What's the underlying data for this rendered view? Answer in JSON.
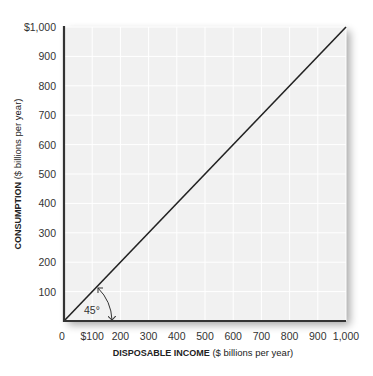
{
  "chart_data": {
    "type": "line",
    "title": "",
    "xlabel": "DISPOSABLE INCOME ($ billions per year)",
    "xlabel_bold": "DISPOSABLE INCOME",
    "xlabel_rest": " ($ billions per year)",
    "ylabel": "CONSUMPTION ($ billions per year)",
    "ylabel_bold": "CONSUMPTION",
    "ylabel_rest": " ($ billions per year)",
    "xlim": [
      0,
      1000
    ],
    "ylim": [
      0,
      1000
    ],
    "grid": true,
    "x_ticks": [
      "0",
      "$100",
      "200",
      "300",
      "400",
      "500",
      "600",
      "700",
      "800",
      "900",
      "1,000"
    ],
    "y_ticks": [
      "100",
      "200",
      "300",
      "400",
      "500",
      "600",
      "700",
      "800",
      "900",
      "$1,000"
    ],
    "series": [
      {
        "name": "45-degree line",
        "x": [
          0,
          1000
        ],
        "y": [
          0,
          1000
        ],
        "color": "#222222"
      }
    ],
    "annotations": [
      {
        "text": "45°",
        "type": "angle-arc",
        "at": [
          0,
          0
        ]
      }
    ]
  }
}
